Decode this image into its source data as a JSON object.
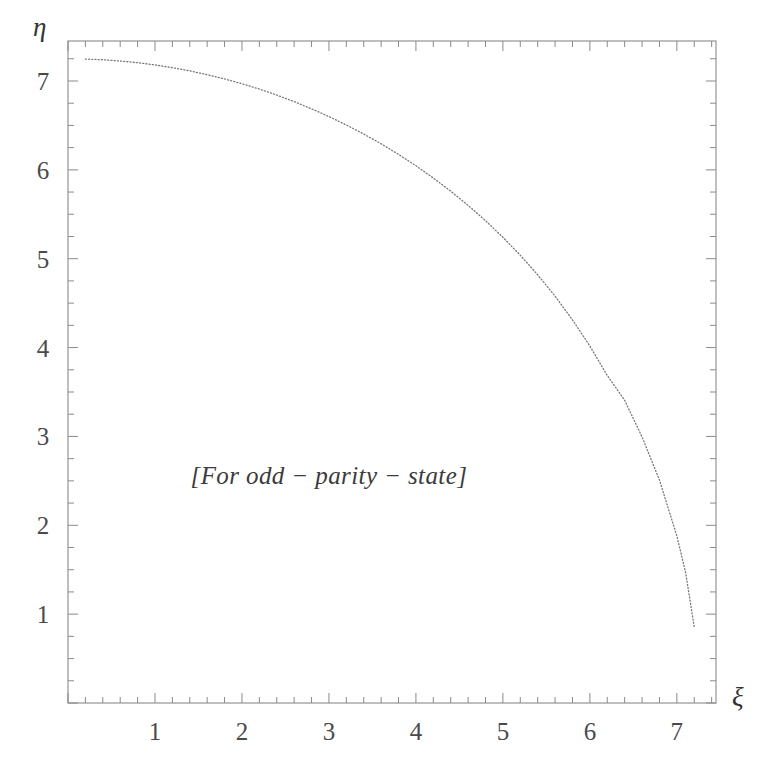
{
  "chart_data": {
    "type": "line",
    "title": "",
    "subtitle": "",
    "xlabel": "ξ",
    "ylabel": "η",
    "xlim": [
      0,
      7.45
    ],
    "ylim": [
      0,
      7.45
    ],
    "grid": false,
    "legend": null,
    "annotations": [
      {
        "text": "[For odd − parity − state]",
        "x": 3.0,
        "y": 2.55
      }
    ],
    "xticks": [
      1,
      2,
      3,
      4,
      5,
      6,
      7
    ],
    "xticklabels": [
      "1",
      "2",
      "3",
      "4",
      "5",
      "6",
      "7"
    ],
    "yticks": [
      1,
      2,
      3,
      4,
      5,
      6,
      7
    ],
    "yticklabels": [
      "1",
      "2",
      "3",
      "4",
      "5",
      "6",
      "7"
    ],
    "x_minor_per_major": 5,
    "y_minor_per_major": 4,
    "series": [
      {
        "name": "circle-arc",
        "style": "dotted",
        "color": "#777777",
        "radius": 7.25,
        "equation": "xi^2 + eta^2 = 7.25^2",
        "x": [
          0.2,
          0.4,
          0.6,
          0.8,
          1.0,
          1.2,
          1.4,
          1.6,
          1.8,
          2.0,
          2.2,
          2.4,
          2.6,
          2.8,
          3.0,
          3.2,
          3.4,
          3.6,
          3.8,
          4.0,
          4.2,
          4.4,
          4.6,
          4.8,
          5.0,
          5.2,
          5.4,
          5.6,
          5.8,
          6.0,
          6.2,
          6.4,
          6.6,
          6.8,
          7.0,
          7.1,
          7.2
        ],
        "y": [
          7.247,
          7.239,
          7.225,
          7.206,
          7.181,
          7.15,
          7.114,
          7.071,
          7.023,
          6.969,
          6.909,
          6.841,
          6.768,
          6.687,
          6.6,
          6.505,
          6.403,
          6.293,
          6.174,
          6.046,
          5.908,
          5.76,
          5.6,
          5.428,
          5.241,
          5.039,
          4.819,
          4.578,
          4.312,
          4.017,
          3.686,
          3.406,
          2.994,
          2.509,
          1.88,
          1.472,
          0.853
        ]
      }
    ]
  },
  "axis_labels": {
    "y": "η",
    "x": "ξ"
  },
  "annotation_text": "[For odd − parity − state]",
  "colors": {
    "background": "#ffffff",
    "frame": "#8a8a8a",
    "curve": "#8c8c8c",
    "text": "#3a3a3a"
  }
}
